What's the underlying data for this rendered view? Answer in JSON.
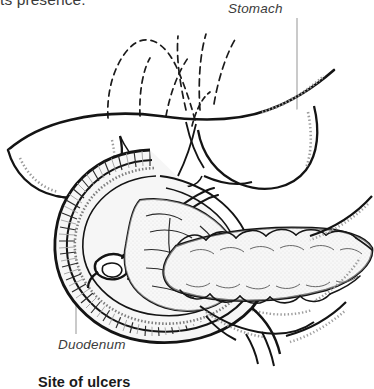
{
  "figure": {
    "name": "anatomical-illustration-stomach-duodenum-pancreas",
    "background_color": "#ffffff",
    "ink_color": "#141414",
    "label_color": "#3c3c3c",
    "leader_line_color": "#9a9a9a",
    "fill_light": "#f2f2f2",
    "fill_mid": "#e2e2e2"
  },
  "text": {
    "body_fragment_top": "ts presence.",
    "caption_bottom": "Site of ulcers"
  },
  "labels": [
    {
      "id": "stomach",
      "text": "Stomach",
      "style": "italic"
    },
    {
      "id": "duodenum",
      "text": "Duodenum",
      "style": "italic"
    }
  ],
  "structures": [
    "stomach-body",
    "pylorus",
    "duodenal-c-loop",
    "duodenal-mucosal-folds",
    "ampulla-of-vater",
    "common-bile-duct",
    "pancreatic-duct",
    "pancreas-head",
    "pancreas-body",
    "pancreas-tail",
    "hidden-duct-dashed-lines"
  ]
}
